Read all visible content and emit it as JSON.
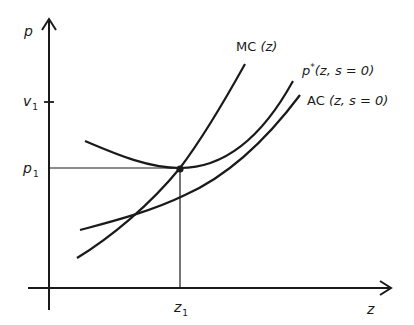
{
  "diagram": {
    "type": "economics-cost-price-curves",
    "colors": {
      "background": "#ffffff",
      "ink": "#1a1a1a"
    },
    "axes": {
      "y_label": "p",
      "x_label": "z"
    },
    "ticks": {
      "y_upper": {
        "base": "v",
        "sub": "1"
      },
      "y_lower": {
        "base": "p",
        "sub": "1"
      },
      "x": {
        "base": "z",
        "sub": "1"
      }
    },
    "curves": {
      "mc": {
        "name": "MC",
        "args": "(z)"
      },
      "p_star": {
        "base": "p",
        "sup": "*",
        "args": "(z, s = 0)"
      },
      "ac": {
        "name": "AC",
        "args": "(z, s = 0)"
      }
    },
    "equilibrium_point": {
      "label_x": "z1",
      "label_y": "p1"
    }
  }
}
